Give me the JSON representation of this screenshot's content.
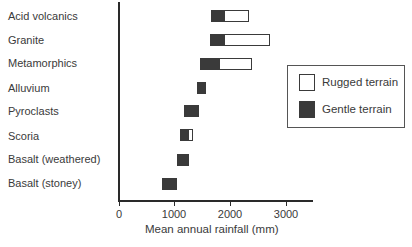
{
  "chart_data": {
    "type": "bar",
    "orientation": "horizontal-range",
    "title": "",
    "xlabel": "Mean annual rainfall (mm)",
    "ylabel": "",
    "xlim": [
      0,
      3500
    ],
    "xticks": [
      0,
      1000,
      2000,
      3000
    ],
    "grid": false,
    "legend_position": "right",
    "categories": [
      "Acid volcanics",
      "Granite",
      "Metamorphics",
      "Alluvium",
      "Pyroclasts",
      "Scoria",
      "Basalt (weathered)",
      "Basalt (stoney)"
    ],
    "series": [
      {
        "name": "Gentle terrain",
        "color": "#3a3a3a",
        "ranges": [
          [
            1650,
            1900
          ],
          [
            1640,
            1900
          ],
          [
            1460,
            1820
          ],
          [
            1400,
            1560
          ],
          [
            1170,
            1440
          ],
          [
            1100,
            1260
          ],
          [
            1040,
            1250
          ],
          [
            770,
            1040
          ]
        ]
      },
      {
        "name": "Rugged terrain",
        "color": "#ffffff",
        "ranges": [
          [
            1900,
            2330
          ],
          [
            1900,
            2710
          ],
          [
            1820,
            2390
          ],
          null,
          null,
          [
            1260,
            1330
          ],
          null,
          null
        ]
      }
    ]
  },
  "labels": {
    "categories": [
      "Acid volcanics",
      "Granite",
      "Metamorphics",
      "Alluvium",
      "Pyroclasts",
      "Scoria",
      "Basalt (weathered)",
      "Basalt (stoney)"
    ],
    "ticks": [
      "0",
      "1000",
      "2000",
      "3000"
    ],
    "xlabel": "Mean annual rainfall (mm)",
    "legend": [
      "Rugged terrain",
      "Gentle terrain"
    ]
  }
}
